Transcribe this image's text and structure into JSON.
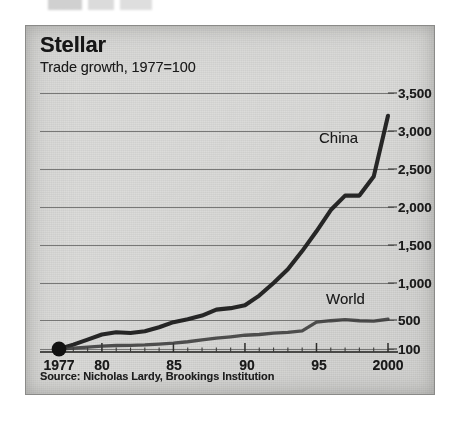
{
  "figure": {
    "title": "Stellar",
    "subtitle": "Trade growth, 1977=100",
    "source": "Source: Nicholas Lardy, Brookings Institution",
    "background_color": "#dcdcda",
    "frame_color": "#8a8a88",
    "ink_color": "#1a1a1a"
  },
  "chart_data": {
    "type": "line",
    "title": "Stellar",
    "subtitle": "Trade growth, 1977=100",
    "xlabel": "",
    "ylabel": "",
    "xlim": [
      1977,
      2000
    ],
    "ylim": [
      100,
      3500
    ],
    "grid": true,
    "grid_orientation": "horizontal",
    "legend_position": "inline-annotation",
    "y_axis_side": "right",
    "y_ticks": [
      100,
      500,
      1000,
      1500,
      2000,
      2500,
      3000,
      3500
    ],
    "y_tick_labels": [
      "100",
      "500",
      "1,000",
      "1,500",
      "2,000",
      "2,500",
      "3,000",
      "3,500"
    ],
    "y_scale_note": "Lowest gridline is the 1977=100 baseline; spacing from 100 to 500 is compressed relative to the even 500-unit steps above it.",
    "x_ticks": [
      1977,
      1980,
      1985,
      1990,
      1995,
      2000
    ],
    "x_tick_labels": [
      "1977",
      "80",
      "85",
      "90",
      "95",
      "2000"
    ],
    "x_minor_ticks_every": 1,
    "origin_marker": {
      "x": 1977,
      "y": 100,
      "shape": "filled-circle",
      "color": "#111111"
    },
    "x": [
      1977,
      1978,
      1979,
      1980,
      1981,
      1982,
      1983,
      1984,
      1985,
      1986,
      1987,
      1988,
      1989,
      1990,
      1991,
      1992,
      1993,
      1994,
      1995,
      1996,
      1997,
      1998,
      1999,
      2000
    ],
    "series": [
      {
        "name": "China",
        "color": "#1c1c1c",
        "label_position": {
          "x": 1996.0,
          "y": 2700
        },
        "values": [
          100,
          160,
          230,
          300,
          330,
          320,
          345,
          400,
          470,
          510,
          560,
          640,
          660,
          700,
          830,
          1000,
          1180,
          1420,
          1680,
          1960,
          2150,
          2150,
          2400,
          3200
        ]
      },
      {
        "name": "World",
        "color": "#3a3a3a",
        "label_position": {
          "x": 1996.3,
          "y": 640
        },
        "values": [
          100,
          112,
          126,
          140,
          148,
          150,
          156,
          168,
          180,
          200,
          225,
          250,
          268,
          290,
          300,
          320,
          330,
          350,
          470,
          490,
          505,
          490,
          485,
          510
        ]
      }
    ],
    "annotations": [
      {
        "text": "China",
        "series": "China"
      },
      {
        "text": "World",
        "series": "World"
      }
    ]
  },
  "y_axis_labels": [
    {
      "value": 3500,
      "text": "3,500",
      "top": 61
    },
    {
      "value": 3000,
      "text": "3,000",
      "top": 99
    },
    {
      "value": 2500,
      "text": "2,500",
      "top": 137
    },
    {
      "value": 2000,
      "text": "2,000",
      "top": 175
    },
    {
      "value": 1500,
      "text": "1,500",
      "top": 213
    },
    {
      "value": 1000,
      "text": "1,000",
      "top": 251
    },
    {
      "value": 500,
      "text": "500",
      "top": 288
    },
    {
      "value": 100,
      "text": "100",
      "top": 317
    }
  ],
  "x_axis_labels": [
    {
      "value": 1977,
      "text": "1977",
      "left": 33
    },
    {
      "value": 1980,
      "text": "80",
      "left": 76
    },
    {
      "value": 1985,
      "text": "85",
      "left": 148
    },
    {
      "value": 1990,
      "text": "90",
      "left": 221
    },
    {
      "value": 1995,
      "text": "95",
      "left": 293
    },
    {
      "value": 2000,
      "text": "2000",
      "left": 362
    }
  ]
}
